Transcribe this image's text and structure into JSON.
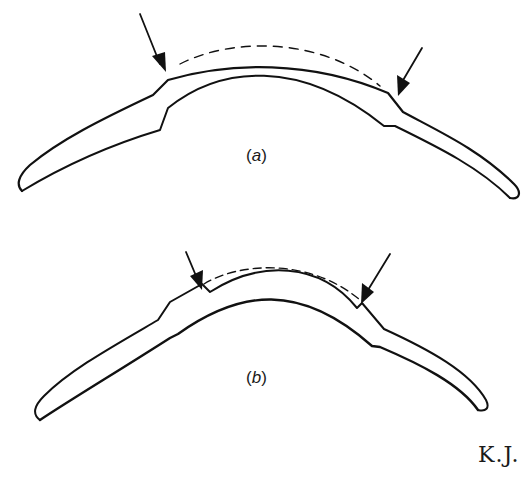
{
  "figure": {
    "panels": [
      {
        "id": "a",
        "label_open": "(",
        "label_letter": "a",
        "label_close": ")"
      },
      {
        "id": "b",
        "label_open": "(",
        "label_letter": "b",
        "label_close": ")"
      }
    ],
    "signature": "K.J.",
    "colors": {
      "ink": "#111111",
      "background": "#ffffff"
    }
  }
}
